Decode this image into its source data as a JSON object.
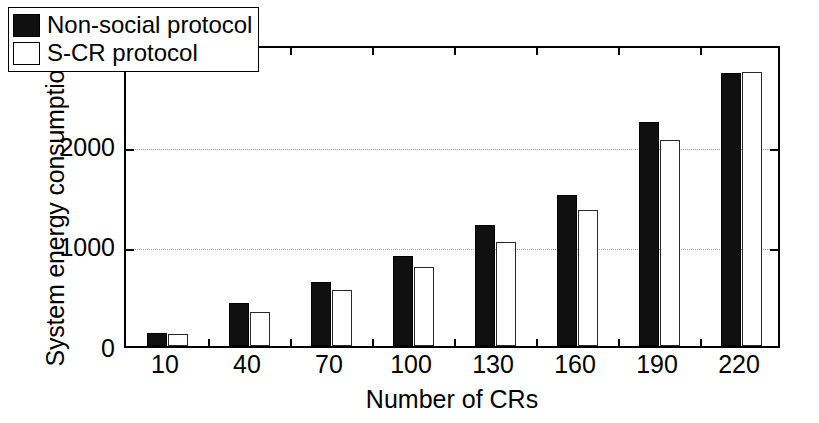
{
  "chart_data": {
    "type": "bar",
    "title": "",
    "xlabel": "Number of CRs",
    "ylabel": "System energy consumption (J)",
    "categories": [
      "10",
      "40",
      "70",
      "100",
      "130",
      "160",
      "190",
      "220"
    ],
    "series": [
      {
        "name": "Non-social protocol",
        "color": "#101010",
        "fill": "solid-black",
        "values": [
          130,
          430,
          640,
          890,
          1200,
          1500,
          2230,
          2710
        ]
      },
      {
        "name": "S-CR protocol",
        "color": "#ffffff",
        "fill": "white-outlined",
        "values": [
          120,
          340,
          560,
          780,
          1030,
          1350,
          2050,
          2720
        ]
      }
    ],
    "ylim": [
      0,
      3000
    ],
    "yticks": [
      0,
      1000,
      2000,
      3000
    ],
    "ytick_labels": [
      "0",
      "1000",
      "2000",
      "3000"
    ],
    "xticks": [
      "10",
      "40",
      "70",
      "100",
      "130",
      "160",
      "190",
      "220"
    ],
    "grid": "horizontal-dotted",
    "legend_position": "top-left-inside",
    "legend": [
      "Non-social protocol",
      "S-CR protocol"
    ]
  },
  "axes": {
    "y_title": "System energy consumption (J)",
    "x_title": "Number of CRs",
    "y_labels": [
      "3000",
      "2000",
      "1000",
      "0"
    ],
    "x_labels": [
      "10",
      "40",
      "70",
      "100",
      "130",
      "160",
      "190",
      "220"
    ]
  },
  "legend": {
    "entries": [
      {
        "label": "Non-social protocol",
        "swatch": "filled-black-square"
      },
      {
        "label": "S-CR protocol",
        "swatch": "open-white-square"
      }
    ]
  }
}
